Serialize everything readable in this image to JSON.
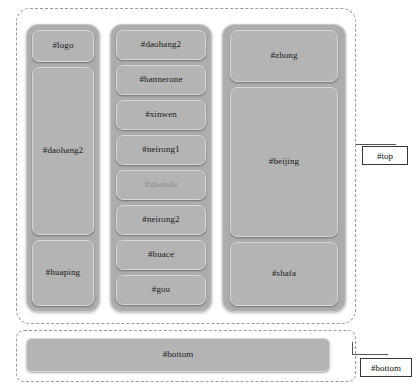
{
  "diagram": {
    "colors": {
      "card_fill": "#b4b4b4",
      "container_fill": "#adadad",
      "dashed_border": "#9a9a9a",
      "callout_border": "#3a3a3a",
      "text": "#1a1a1a",
      "background": "#ffffff"
    }
  },
  "regions": {
    "top": {
      "callout_label": "#top",
      "columns": [
        {
          "name": "left-column",
          "cards": [
            {
              "label": "#logo"
            },
            {
              "label": "#daohang2"
            },
            {
              "label": "#huaping"
            }
          ]
        },
        {
          "name": "middle-column",
          "cards": [
            {
              "label": "#daohang2"
            },
            {
              "label": "#bannerone"
            },
            {
              "label": "#xinwen"
            },
            {
              "label": "#neirong1"
            },
            {
              "label": "#zhanshi"
            },
            {
              "label": "#neirong2"
            },
            {
              "label": "#huace"
            },
            {
              "label": "#gou"
            }
          ]
        },
        {
          "name": "right-column",
          "cards": [
            {
              "label": "#zhong"
            },
            {
              "label": "#beijing"
            },
            {
              "label": "#shafa"
            }
          ]
        }
      ]
    },
    "bottom": {
      "callout_label": "#bottom",
      "bar_label": "#bottom"
    }
  }
}
